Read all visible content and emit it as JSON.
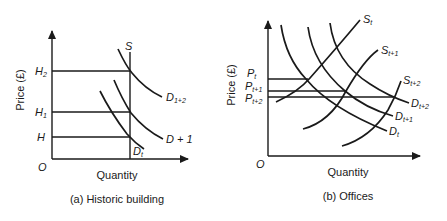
{
  "panels": [
    {
      "id": "a",
      "caption": "(a) Historic building",
      "ylabel": "Price (£)",
      "xlabel": "Quantity",
      "origin": "O",
      "price_levels": [
        {
          "main": "H",
          "sub": "2"
        },
        {
          "main": "H",
          "sub": "1"
        },
        {
          "main": "H",
          "sub": ""
        }
      ],
      "supply": {
        "main": "S",
        "sub": ""
      },
      "demand_curves": [
        {
          "main": "D",
          "sub": "1+2"
        },
        {
          "main": "D + 1",
          "sub": ""
        },
        {
          "main": "D",
          "sub": "t"
        }
      ]
    },
    {
      "id": "b",
      "caption": "(b) Offices",
      "ylabel": "Price (£)",
      "xlabel": "Quantity",
      "origin": "O",
      "price_levels": [
        {
          "main": "P",
          "sub": "t"
        },
        {
          "main": "P",
          "sub": "t+1"
        },
        {
          "main": "P",
          "sub": "t+2"
        }
      ],
      "supply_curves": [
        {
          "main": "S",
          "sub": "t"
        },
        {
          "main": "S",
          "sub": "t+1"
        },
        {
          "main": "S",
          "sub": "t+2"
        }
      ],
      "demand_curves": [
        {
          "main": "D",
          "sub": "t+2"
        },
        {
          "main": "D",
          "sub": "t+1"
        },
        {
          "main": "D",
          "sub": "t"
        }
      ]
    }
  ]
}
